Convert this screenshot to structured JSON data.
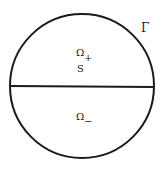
{
  "diagram": {
    "boundary_label": "Γ",
    "upper_region_label": "Ω",
    "upper_region_sub": "+",
    "interface_label": "S",
    "lower_region_label": "Ω",
    "lower_region_sub": "−",
    "stroke_color": "#1a1a1a"
  }
}
